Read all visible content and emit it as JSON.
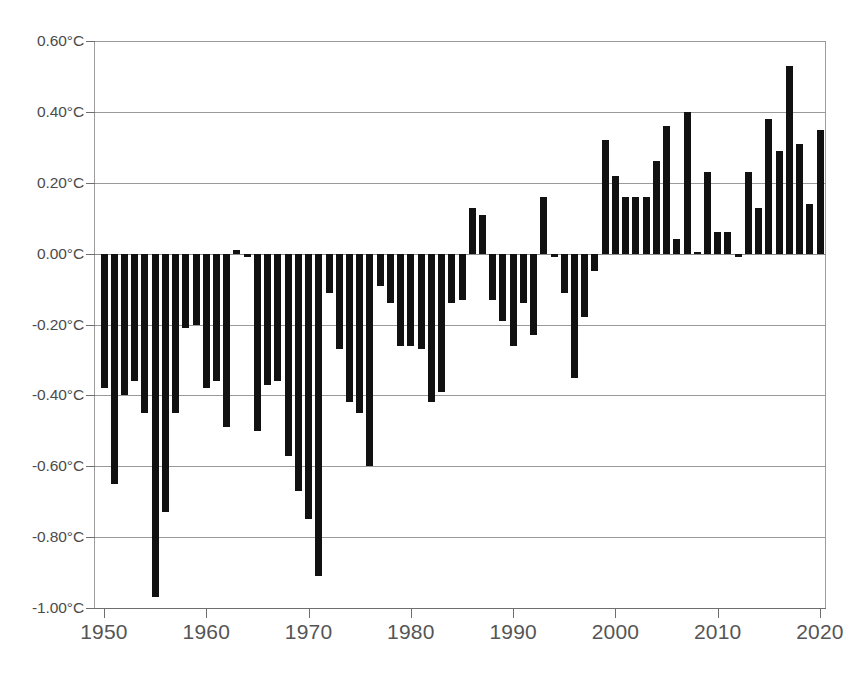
{
  "chart_data": {
    "type": "bar",
    "title": "",
    "subtitle": "",
    "xlabel": "",
    "ylabel": "",
    "unit": "°C",
    "grid": true,
    "legend": null,
    "bar_color": "#111111",
    "gridline_color": "#9a9a9a",
    "axis_text_color": "#555555",
    "xlim": [
      1949.5,
      2020.5
    ],
    "ylim": [
      -1.0,
      0.6
    ],
    "x_tick_labels": [
      "1950",
      "1960",
      "1970",
      "1980",
      "1990",
      "2000",
      "2010",
      "2020"
    ],
    "x_tick_values": [
      1950,
      1960,
      1970,
      1980,
      1990,
      2000,
      2010,
      2020
    ],
    "y_tick_labels": [
      "0.60°C",
      "0.40°C",
      "0.20°C",
      "0.00°C",
      "-0.20°C",
      "-0.40°C",
      "-0.60°C",
      "-0.80°C",
      "-1.00°C"
    ],
    "y_tick_values": [
      0.6,
      0.4,
      0.2,
      0.0,
      -0.2,
      -0.4,
      -0.6,
      -0.8,
      -1.0
    ],
    "categories": [
      1950,
      1951,
      1952,
      1953,
      1954,
      1955,
      1956,
      1957,
      1958,
      1959,
      1960,
      1961,
      1962,
      1963,
      1964,
      1965,
      1966,
      1967,
      1968,
      1969,
      1970,
      1971,
      1972,
      1973,
      1974,
      1975,
      1976,
      1977,
      1978,
      1979,
      1980,
      1981,
      1982,
      1983,
      1984,
      1985,
      1986,
      1987,
      1988,
      1989,
      1990,
      1991,
      1992,
      1993,
      1994,
      1995,
      1996,
      1997,
      1998,
      1999,
      2000,
      2001,
      2002,
      2003,
      2004,
      2005,
      2006,
      2007,
      2008,
      2009,
      2010,
      2011,
      2012,
      2013,
      2014,
      2015,
      2016,
      2017,
      2018,
      2019,
      2020
    ],
    "values": [
      -0.38,
      -0.65,
      -0.4,
      -0.36,
      -0.45,
      -0.97,
      -0.73,
      -0.45,
      -0.21,
      -0.2,
      -0.38,
      -0.36,
      -0.49,
      0.01,
      -0.01,
      -0.5,
      -0.37,
      -0.36,
      -0.57,
      -0.67,
      -0.75,
      -0.91,
      -0.11,
      -0.27,
      -0.42,
      -0.45,
      -0.6,
      -0.09,
      -0.14,
      -0.26,
      -0.26,
      -0.27,
      -0.42,
      -0.39,
      -0.14,
      -0.13,
      0.13,
      0.11,
      -0.13,
      -0.19,
      -0.26,
      -0.14,
      -0.23,
      0.16,
      -0.01,
      -0.11,
      -0.35,
      -0.18,
      -0.05,
      0.32,
      0.22,
      0.16,
      0.16,
      0.16,
      0.26,
      0.36,
      0.04,
      0.4,
      0.0,
      0.23,
      0.06,
      0.06,
      -0.01,
      0.23,
      0.13,
      0.38,
      0.29,
      0.53,
      0.31,
      0.14,
      0.35
    ]
  }
}
